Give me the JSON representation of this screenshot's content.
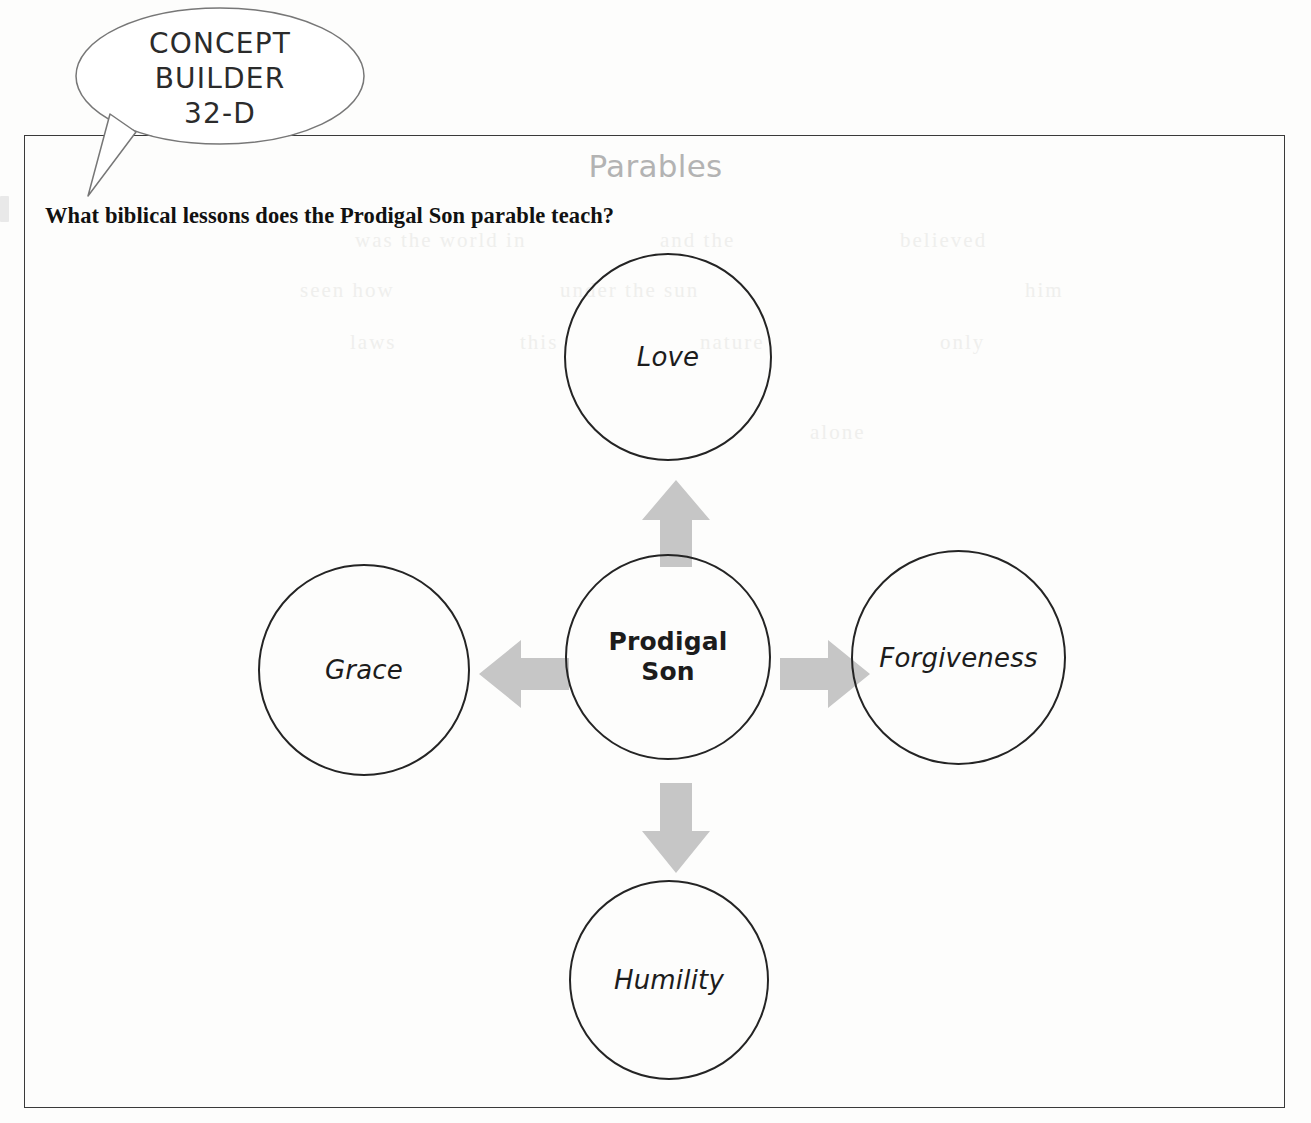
{
  "badge": {
    "line1": "CONCEPT",
    "line2": "BUILDER",
    "line3": "32-D"
  },
  "header": {
    "title": "Parables",
    "title_color": "#b3b3b3",
    "question": "What biblical lessons does the Prodigal Son parable teach?"
  },
  "diagram": {
    "type": "radial-concept-map",
    "center": {
      "label_line1": "Prodigal",
      "label_line2": "Son",
      "label": "Prodigal Son"
    },
    "nodes": [
      {
        "id": "love",
        "label": "Love",
        "position": "top"
      },
      {
        "id": "grace",
        "label": "Grace",
        "position": "left"
      },
      {
        "id": "forgiveness",
        "label": "Forgiveness",
        "position": "right"
      },
      {
        "id": "humility",
        "label": "Humility",
        "position": "bottom"
      }
    ],
    "arrows": [
      {
        "from": "center",
        "to": "love",
        "direction": "up"
      },
      {
        "from": "center",
        "to": "grace",
        "direction": "left"
      },
      {
        "from": "center",
        "to": "forgiveness",
        "direction": "right"
      },
      {
        "from": "center",
        "to": "humility",
        "direction": "down"
      }
    ],
    "arrow_color": "#c6c6c6",
    "outline_color": "#242424"
  },
  "scan": {
    "showthrough": [
      {
        "text": "was the world in",
        "x": 355,
        "y": 228
      },
      {
        "text": "and the",
        "x": 660,
        "y": 228
      },
      {
        "text": "believed",
        "x": 900,
        "y": 228
      },
      {
        "text": "seen how",
        "x": 300,
        "y": 278
      },
      {
        "text": "under the sun",
        "x": 560,
        "y": 278
      },
      {
        "text": "him",
        "x": 1025,
        "y": 278
      },
      {
        "text": "laws",
        "x": 350,
        "y": 330
      },
      {
        "text": "this",
        "x": 520,
        "y": 330
      },
      {
        "text": "nature",
        "x": 700,
        "y": 330
      },
      {
        "text": "only",
        "x": 940,
        "y": 330
      },
      {
        "text": "alone",
        "x": 810,
        "y": 420
      }
    ]
  }
}
